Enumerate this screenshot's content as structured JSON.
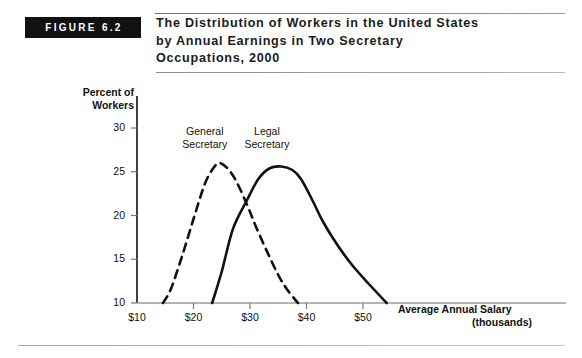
{
  "figure": {
    "tag": "FIGURE 6.2",
    "title_lines": [
      "The Distribution of Workers in the United States",
      "by Annual Earnings in Two Secretary",
      "Occupations, 2000"
    ]
  },
  "chart_data": {
    "type": "line",
    "title": "The Distribution of Workers in the United States by Annual Earnings in Two Secretary Occupations, 2000",
    "xlabel": "Average Annual Salary (thousands)",
    "xlabel_line1": "Average Annual Salary",
    "xlabel_line2": "(thousands)",
    "ylabel": "Percent of Workers",
    "ylabel_line1": "Percent of",
    "ylabel_line2": "Workers",
    "xlim": [
      5,
      57
    ],
    "ylim": [
      10,
      32
    ],
    "xticks": [
      10,
      20,
      30,
      40,
      50
    ],
    "xtick_labels": [
      "$10",
      "$20",
      "$30",
      "$40",
      "$50"
    ],
    "yticks": [
      10,
      15,
      20,
      25,
      30
    ],
    "ytick_labels": [
      "10",
      "15",
      "20",
      "25",
      "30"
    ],
    "grid": false,
    "legend_position": "inline-annotations",
    "annotations": [
      {
        "text": "General Secretary",
        "line1": "General",
        "line2": "Secretary",
        "x": 22.0,
        "y": 29.5
      },
      {
        "text": "Legal Secretary",
        "line1": "Legal",
        "line2": "Secretary",
        "x": 33.0,
        "y": 29.5
      }
    ],
    "series": [
      {
        "name": "General Secretary",
        "style": "dashed",
        "color": "#111111",
        "x": [
          14.6,
          16,
          18,
          20,
          22,
          23.5,
          24.6,
          26,
          27.5,
          29.5,
          31,
          33,
          35,
          36.5,
          38.5
        ],
        "y": [
          10.0,
          11.6,
          15.4,
          19.6,
          23.6,
          25.4,
          26.0,
          25.4,
          24.0,
          21.2,
          18.8,
          15.9,
          13.2,
          11.6,
          10.0
        ]
      },
      {
        "name": "Legal Secretary",
        "style": "solid",
        "color": "#111111",
        "x": [
          23.3,
          25,
          27,
          29.5,
          31.5,
          33.5,
          35.5,
          37.5,
          39,
          41,
          43,
          45.5,
          48,
          51,
          54.2
        ],
        "y": [
          10.0,
          13.6,
          18.5,
          21.8,
          24.2,
          25.4,
          25.6,
          25.2,
          24.2,
          21.8,
          19.2,
          16.6,
          14.4,
          12.2,
          10.0
        ]
      }
    ]
  }
}
